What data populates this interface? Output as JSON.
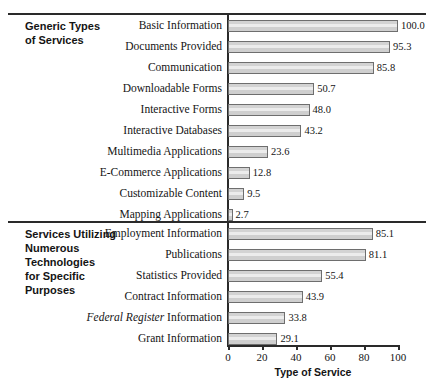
{
  "chart_data": {
    "type": "bar",
    "orientation": "horizontal",
    "title": "",
    "xlabel": "Type of Service",
    "ylabel": "",
    "xlim": [
      0,
      100
    ],
    "xticks": [
      0,
      20,
      40,
      60,
      80,
      100
    ],
    "grid": false,
    "legend": null,
    "groups": [
      {
        "group_label": "Generic Types\nof Services",
        "group_label_lines": [
          "Generic Types",
          "of Services"
        ],
        "categories": [
          "Basic Information",
          "Documents Provided",
          "Communication",
          "Downloadable Forms",
          "Interactive Forms",
          "Interactive Databases",
          "Multimedia Applications",
          "E-Commerce Applications",
          "Customizable Content",
          "Mapping Applications"
        ],
        "values": [
          100.0,
          95.3,
          85.8,
          50.7,
          48.0,
          43.2,
          23.6,
          12.8,
          9.5,
          2.7
        ],
        "value_labels": [
          "100.0",
          "95.3",
          "85.8",
          "50.7",
          "48.0",
          "43.2",
          "23.6",
          "12.8",
          "9.5",
          "2.7"
        ]
      },
      {
        "group_label": "Services Utilizing\nNumerous\nTechnologies\nfor Specific\nPurposes",
        "group_label_lines": [
          "Services Utilizing",
          "Numerous",
          "Technologies",
          "for Specific",
          "Purposes"
        ],
        "categories": [
          "Employment Information",
          "Publications",
          "Statistics Provided",
          "Contract Information",
          "Federal Register Information",
          "Grant Information"
        ],
        "categories_markup": [
          {
            "text": "Employment Information",
            "italic_prefix": ""
          },
          {
            "text": "Publications",
            "italic_prefix": ""
          },
          {
            "text": "Statistics Provided",
            "italic_prefix": ""
          },
          {
            "text": "Contract Information",
            "italic_prefix": ""
          },
          {
            "text": "Information",
            "italic_prefix": "Federal Register"
          },
          {
            "text": "Grant Information",
            "italic_prefix": ""
          }
        ],
        "values": [
          85.1,
          81.1,
          55.4,
          43.9,
          33.8,
          29.1
        ],
        "value_labels": [
          "85.1",
          "81.1",
          "55.4",
          "43.9",
          "33.8",
          "29.1"
        ]
      }
    ],
    "colors": {
      "bar_fill": "#d3d3d3",
      "bar_highlight": "#ececec",
      "bar_border": "#6e6e6e",
      "axis": "#2a2a2a",
      "text": "#141414",
      "background": "#ffffff"
    }
  }
}
